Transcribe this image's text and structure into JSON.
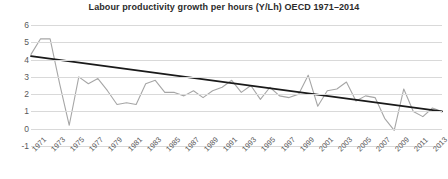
{
  "chart_data": {
    "type": "line",
    "title": "Labour productivity growth per hours (Y/Lh) OECD 1971–2014",
    "xlabel": "",
    "ylabel": "",
    "ylim": [
      -1,
      6
    ],
    "yticks": [
      6,
      5,
      4,
      3,
      2,
      1,
      0,
      -1
    ],
    "ytick_labels": [
      "6",
      "5",
      "4",
      "3",
      "2",
      "1",
      "0",
      "-1"
    ],
    "grid": true,
    "legend": "none",
    "xlim": [
      1971,
      2014
    ],
    "xtick_labels": [
      "1971",
      "1973",
      "1975",
      "1977",
      "1979",
      "1981",
      "1983",
      "1985",
      "1987",
      "1989",
      "1991",
      "1993",
      "1995",
      "1997",
      "1999",
      "2001",
      "2003",
      "2005",
      "2007",
      "2009",
      "2011",
      "2013"
    ],
    "x": [
      1971,
      1972,
      1973,
      1974,
      1975,
      1976,
      1977,
      1978,
      1979,
      1980,
      1981,
      1982,
      1983,
      1984,
      1985,
      1986,
      1987,
      1988,
      1989,
      1990,
      1991,
      1992,
      1993,
      1994,
      1995,
      1996,
      1997,
      1998,
      1999,
      2000,
      2001,
      2002,
      2003,
      2004,
      2005,
      2006,
      2007,
      2008,
      2009,
      2010,
      2011,
      2012,
      2013,
      2014
    ],
    "series": [
      {
        "name": "Labour productivity growth (Y/Lh)",
        "color": "#a6a6a6",
        "values": [
          4.3,
          5.2,
          5.2,
          2.6,
          0.2,
          3.0,
          2.6,
          2.9,
          2.2,
          1.4,
          1.5,
          1.4,
          2.6,
          2.8,
          2.1,
          2.1,
          1.9,
          2.2,
          1.8,
          2.2,
          2.4,
          2.8,
          2.1,
          2.5,
          1.7,
          2.4,
          1.9,
          1.8,
          2.0,
          3.1,
          1.3,
          2.2,
          2.3,
          2.7,
          1.6,
          1.9,
          1.8,
          0.6,
          -0.1,
          2.3,
          1.0,
          0.7,
          1.2,
          1.0
        ]
      },
      {
        "name": "Linear trend",
        "color": "#1a1a1a",
        "type": "trendline",
        "start_value": 4.2,
        "end_value": 1.0
      }
    ]
  },
  "axis": {
    "y_labels": [
      "6",
      "5",
      "4",
      "3",
      "2",
      "1",
      "0",
      "-1"
    ],
    "x_labels": [
      "1971",
      "1973",
      "1975",
      "1977",
      "1979",
      "1981",
      "1983",
      "1985",
      "1987",
      "1989",
      "1991",
      "1993",
      "1995",
      "1997",
      "1999",
      "2001",
      "2003",
      "2005",
      "2007",
      "2009",
      "2011",
      "2013"
    ]
  },
  "colors": {
    "series": "#a6a6a6",
    "trend": "#1a1a1a",
    "grid": "#d9d9d9",
    "text": "#595959",
    "title": "#2b2b2b",
    "background": "#ffffff"
  }
}
